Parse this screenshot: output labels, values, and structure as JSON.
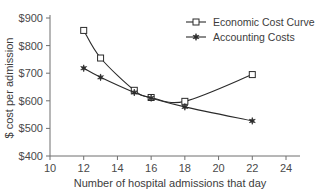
{
  "chart_data": {
    "type": "line",
    "title": "",
    "xlabel": "Number of hospital admissions that day",
    "ylabel": "$ cost per admission",
    "xlim": [
      10,
      24
    ],
    "ylim": [
      400,
      900
    ],
    "xticks": [
      10,
      12,
      14,
      16,
      18,
      20,
      22,
      24
    ],
    "xtick_labels": [
      "10",
      "12",
      "14",
      "16",
      "18",
      "20",
      "22",
      "24"
    ],
    "yticks": [
      400,
      500,
      600,
      700,
      800,
      900
    ],
    "ytick_labels": [
      "$400",
      "$500",
      "$600",
      "$700",
      "$800",
      "$900"
    ],
    "grid": false,
    "legend_position": "upper-right",
    "series": [
      {
        "name": "Economic Cost Curve",
        "marker": "open-square",
        "color": "#2b2b2b",
        "x": [
          12,
          13,
          15,
          16,
          18,
          22
        ],
        "values": [
          855,
          755,
          638,
          612,
          598,
          695
        ]
      },
      {
        "name": "Accounting Costs",
        "marker": "filled-star",
        "color": "#2b2b2b",
        "x": [
          12,
          13,
          15,
          16,
          18,
          22
        ],
        "values": [
          718,
          685,
          630,
          610,
          578,
          527
        ]
      }
    ]
  },
  "legend": {
    "items": [
      {
        "label": "Economic Cost Curve"
      },
      {
        "label": "Accounting Costs"
      }
    ]
  }
}
